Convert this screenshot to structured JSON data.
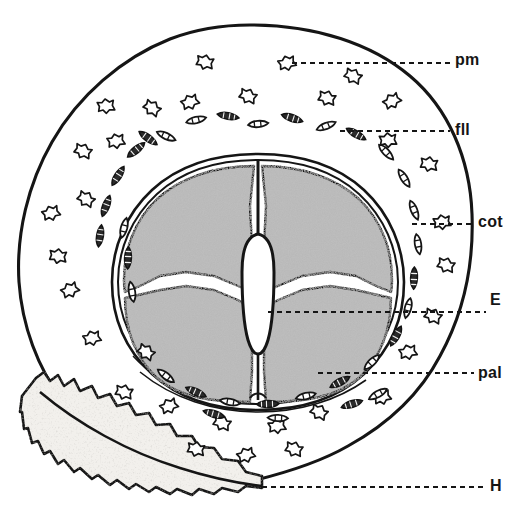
{
  "figure": {
    "type": "hand-drawn botanical cross-section",
    "background_color": "#ffffff",
    "ink_color": "#151515",
    "cotyledon_fill_color": "#b9b9b9",
    "hilum_fill_color": "#f2f0ec"
  },
  "labels": [
    {
      "key": "pm",
      "text": "pm",
      "name": "label-pm",
      "x": 455,
      "y": 52,
      "leader": {
        "x1": 292,
        "y1": 63,
        "x2": 450,
        "y2": 63
      }
    },
    {
      "key": "fll",
      "text": "fll",
      "name": "label-fll",
      "x": 455,
      "y": 122,
      "leader": {
        "x1": 340,
        "y1": 131,
        "x2": 450,
        "y2": 131
      }
    },
    {
      "key": "cot",
      "text": "cot",
      "name": "label-cot",
      "x": 478,
      "y": 214,
      "leader": {
        "x1": 412,
        "y1": 224,
        "x2": 474,
        "y2": 224
      }
    },
    {
      "key": "E",
      "text": "E",
      "name": "label-e",
      "x": 490,
      "y": 292,
      "leader": {
        "x1": 268,
        "y1": 312,
        "x2": 486,
        "y2": 312
      }
    },
    {
      "key": "pal",
      "text": "pal",
      "name": "label-pal",
      "x": 478,
      "y": 367,
      "leader": {
        "x1": 318,
        "y1": 373,
        "x2": 474,
        "y2": 373
      }
    },
    {
      "key": "H",
      "text": "H",
      "name": "label-h",
      "x": 490,
      "y": 478,
      "leader": {
        "x1": 262,
        "y1": 487,
        "x2": 486,
        "y2": 487
      }
    }
  ],
  "structures": {
    "outer_coat": "seed outer integument outline",
    "hilum_band": "ragged stippled basal band",
    "inner_seed": "endosperm / inner coat ring",
    "cotyledons": "four shaded cotyledon lobes",
    "embryo_axis": "central white embryo axis",
    "sclereids": "scattered star-shaped stone cells",
    "fibre_cells": "elongated segmented fibre cells"
  }
}
